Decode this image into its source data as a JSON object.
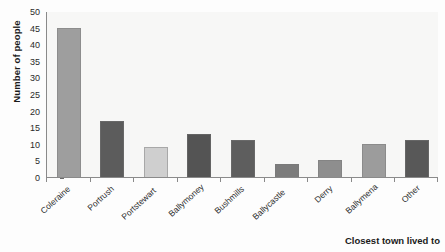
{
  "chart_data": {
    "type": "bar",
    "title": "",
    "subtitle": "",
    "xlabel": "Closest town lived to",
    "ylabel": "Number of people",
    "categories": [
      "Coleraine",
      "Portrush",
      "Portstewart",
      "Ballymoney",
      "Bushmills",
      "Ballycastle",
      "Derry",
      "Ballymena",
      "Other"
    ],
    "values": [
      45,
      17,
      9,
      13,
      11,
      4,
      5,
      10,
      11
    ],
    "bar_colors": [
      "#9e9e9e",
      "#5c5c5c",
      "#cfcfcf",
      "#545454",
      "#5e5e5e",
      "#7c7c7c",
      "#8e8e8e",
      "#9c9c9c",
      "#585858"
    ],
    "ylim": [
      0,
      50
    ],
    "ytick_step": 5,
    "ytick_labels": [
      "0",
      "5",
      "10",
      "15",
      "20",
      "25",
      "30",
      "35",
      "40",
      "45",
      "50"
    ],
    "grid": false,
    "legend": "none",
    "plot_background": "#f7f7f6",
    "axis_color": "#8a8a8a"
  }
}
